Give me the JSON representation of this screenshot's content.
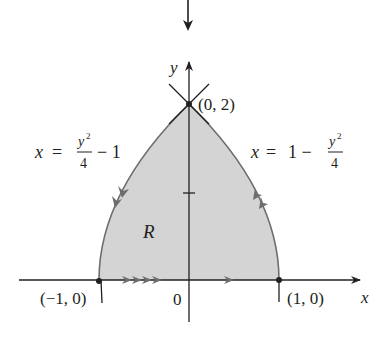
{
  "figure": {
    "type": "region-diagram",
    "colors": {
      "region_fill": "#d4d4d4",
      "curve": "#6d6d6d",
      "axis": "#231f20",
      "text": "#231f20"
    },
    "axes": {
      "x_label": "x",
      "y_label": "y",
      "origin_label": "0",
      "y_tick": 1
    },
    "points": [
      {
        "label": "(0, 2)",
        "x": 0,
        "y": 2
      },
      {
        "label": "(−1, 0)",
        "x": -1,
        "y": 0
      },
      {
        "label": "(1, 0)",
        "x": 1,
        "y": 0
      }
    ],
    "curves": {
      "left": {
        "lhs": "x",
        "eq": "=",
        "num": "y",
        "exp": "2",
        "den": "4",
        "tail": "− 1",
        "full": "x = y^2/4 - 1"
      },
      "right": {
        "lhs": "x",
        "eq": "=",
        "head": "1 −",
        "num": "y",
        "exp": "2",
        "den": "4",
        "full": "x = 1 - y^2/4"
      }
    },
    "region_label": "R",
    "top_arrow": "down-arrow"
  }
}
